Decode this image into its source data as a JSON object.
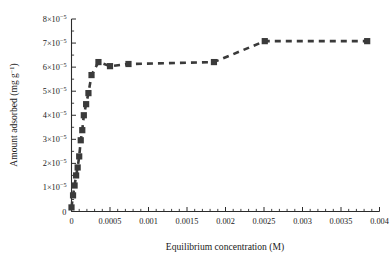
{
  "chart_data": {
    "type": "line",
    "title": "",
    "xlabel": "Equilibrium concentration (M)",
    "ylabel": "Amount adsorbed (mg g-1)",
    "ylabel_base": "Amount adsorbed (mg g",
    "ylabel_sup": "−1",
    "ylabel_tail": ")",
    "xlim": [
      0,
      0.004
    ],
    "ylim": [
      0,
      8e-05
    ],
    "grid": false,
    "legend": null,
    "marker_style": "filled-square",
    "line_style": "dashed",
    "series_color": "#3a3a3a",
    "x_ticklabels": [
      "0",
      "0.0005",
      "0.001",
      "0.0015",
      "0.002",
      "0.0025",
      "0.003",
      "0.0035",
      "0.004"
    ],
    "x_tickvalues": [
      0,
      0.0005,
      0.001,
      0.0015,
      0.002,
      0.0025,
      0.003,
      0.0035,
      0.004
    ],
    "x_minor_interval": 0.0001,
    "y_ticklabels": [
      "0",
      "1×10-5",
      "2×10-5",
      "3×10-5",
      "4×10-5",
      "5×10-5",
      "6×10-5",
      "7×10-5",
      "8×10-5"
    ],
    "y_tick_mantissa": [
      "0",
      "1",
      "2",
      "3",
      "4",
      "5",
      "6",
      "7",
      "8"
    ],
    "y_tick_exponent": "−5",
    "y_tickvalues": [
      0,
      1e-05,
      2e-05,
      3e-05,
      4e-05,
      5e-05,
      6e-05,
      7e-05,
      8e-05
    ],
    "y_minor_interval": 5e-06,
    "series": [
      {
        "name": "adsorption isotherm",
        "x": [
          0.0,
          2e-05,
          4e-05,
          6e-05,
          8e-05,
          0.0001,
          0.00012,
          0.00014,
          0.00016,
          0.00019,
          0.00022,
          0.00026,
          0.00035,
          0.0005,
          0.00074,
          0.00185,
          0.00251,
          0.00384
        ],
        "y": [
          1.7e-06,
          6.7e-06,
          1.08e-05,
          1.5e-05,
          1.83e-05,
          2.29e-05,
          2.96e-05,
          3.38e-05,
          4e-05,
          4.46e-05,
          4.92e-05,
          5.67e-05,
          6.21e-05,
          6.04e-05,
          6.13e-05,
          6.21e-05,
          7.08e-05,
          7.08e-05
        ]
      }
    ]
  }
}
